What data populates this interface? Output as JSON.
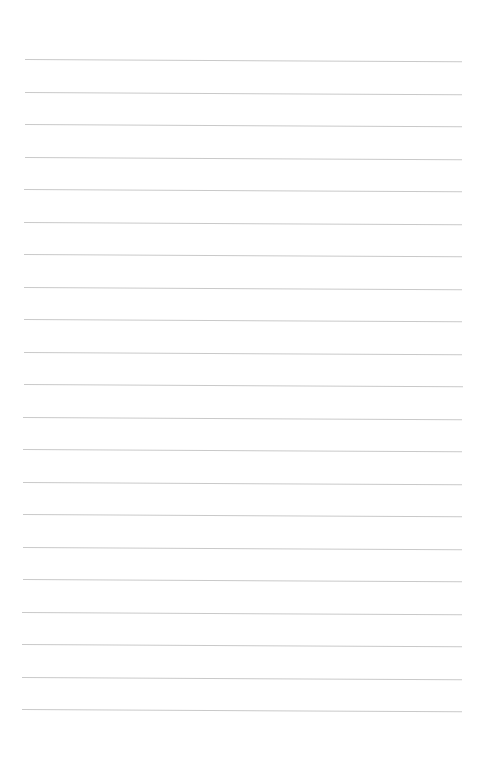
{
  "document": {
    "type": "blank ruled sheet",
    "rule_color": "#c9c9c9",
    "background": "#ffffff",
    "rule_count": 21,
    "first_rule_y": 59,
    "rule_spacing": 32.5,
    "rule_left_x": 25,
    "rule_right_x": 462,
    "text_lines": []
  }
}
